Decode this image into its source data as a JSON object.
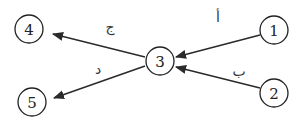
{
  "diagram": {
    "type": "directed-graph",
    "nodes": [
      {
        "id": "1",
        "label": "1",
        "x": 274,
        "y": 30
      },
      {
        "id": "2",
        "label": "2",
        "x": 274,
        "y": 93
      },
      {
        "id": "3",
        "label": "3",
        "x": 160,
        "y": 61
      },
      {
        "id": "4",
        "label": "4",
        "x": 29,
        "y": 29
      },
      {
        "id": "5",
        "label": "5",
        "x": 32,
        "y": 102
      }
    ],
    "edges": [
      {
        "from": "1",
        "to": "3",
        "label": "أ"
      },
      {
        "from": "2",
        "to": "3",
        "label": "ب"
      },
      {
        "from": "3",
        "to": "4",
        "label": "ج"
      },
      {
        "from": "3",
        "to": "5",
        "label": "د"
      }
    ],
    "colors": {
      "stroke": "#222222",
      "background": "#ffffff"
    }
  }
}
